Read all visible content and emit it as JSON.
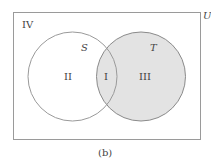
{
  "diagram": {
    "universe_label": "U",
    "region_outside_label": "IV",
    "set_s_label": "S",
    "set_t_label": "T",
    "region_s_only_label": "II",
    "region_intersection_label": "I",
    "region_t_only_label": "III",
    "caption": "(b)",
    "colors": {
      "stroke": "#9a9a9a",
      "shade": "#e3e3e3",
      "text": "#444444"
    }
  }
}
